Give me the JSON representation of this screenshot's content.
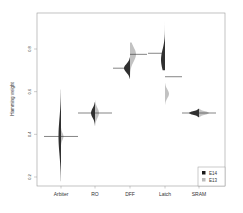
{
  "chart_data": {
    "type": "violin",
    "title": "",
    "xlabel": "",
    "ylabel": "Hamming weight",
    "ylim": [
      0.17,
      0.95
    ],
    "yticks": [
      0.2,
      0.4,
      0.6,
      0.8
    ],
    "ytick_labels": [
      "0.2",
      "0.4",
      "0.6",
      "0.8"
    ],
    "categories": [
      "Arbiter",
      "RO",
      "DFF",
      "Latch",
      "SRAM"
    ],
    "series": [
      {
        "name": "E14",
        "color": "#1a1a1a",
        "distributions": [
          {
            "category": "Arbiter",
            "mean": 0.39,
            "min": 0.18,
            "max": 0.61,
            "mode": 0.39
          },
          {
            "category": "RO",
            "mean": 0.5,
            "min": 0.44,
            "max": 0.55,
            "mode": 0.5
          },
          {
            "category": "DFF",
            "mean": 0.71,
            "min": 0.66,
            "max": 0.76,
            "mode": 0.71
          },
          {
            "category": "Latch",
            "mean": 0.78,
            "min": 0.7,
            "max": 0.94,
            "mode": 0.75
          },
          {
            "category": "SRAM",
            "mean": 0.5,
            "min": 0.48,
            "max": 0.52,
            "mode": 0.5
          }
        ]
      },
      {
        "name": "E13",
        "color": "#bbbbbb",
        "distributions": [
          {
            "category": "Arbiter",
            "mean": 0.39,
            "min": 0.35,
            "max": 0.43,
            "mode": 0.39
          },
          {
            "category": "RO",
            "mean": 0.5,
            "min": 0.44,
            "max": 0.56,
            "mode": 0.5
          },
          {
            "category": "DFF",
            "mean": 0.775,
            "min": 0.66,
            "max": 0.83,
            "mode": 0.775
          },
          {
            "category": "Latch",
            "mean": 0.67,
            "min": 0.54,
            "max": 0.64,
            "mode": 0.59
          },
          {
            "category": "SRAM",
            "mean": 0.5,
            "min": 0.48,
            "max": 0.52,
            "mode": 0.5
          }
        ]
      }
    ],
    "legend": {
      "position": "bottom-right",
      "entries": [
        "E14",
        "E13"
      ]
    },
    "grid": false
  }
}
